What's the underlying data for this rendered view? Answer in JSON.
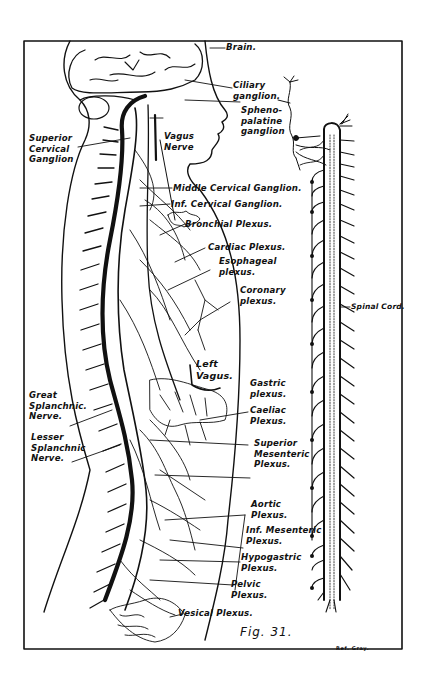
{
  "figure": {
    "caption": "Fig. 31.",
    "credit": "Ref. Gray.",
    "frame_color": "#111111",
    "background": "#ffffff"
  },
  "labels": {
    "brain": "Brain.",
    "ciliary_ganglion": "Ciliary\nganglion.",
    "sphenopalatine_ganglion": "Spheno-\npalatine\nganglion",
    "superior_cervical_ganglion": "Superior\nCervical\nGanglion",
    "vagus_nerve": "Vagus\nNerve",
    "middle_cervical_ganglion": "Middle Cervical Ganglion.",
    "inf_cervical_ganglion": "Inf. Cervical Ganglion.",
    "bronchial_plexus": "Bronchial Plexus.",
    "cardiac_plexus": "Cardiac Plexus.",
    "esophageal_plexus": "Esophageal\nplexus.",
    "coronary_plexus": "Coronary\nplexus.",
    "spinal_cord": "Spinal Cord.",
    "left_vagus": "Left\nVagus.",
    "gastric_plexus": "Gastric\nplexus.",
    "caeliac_plexus": "Caeliac\nPlexus.",
    "great_splanchnic_nerve": "Great\nSplanchnic.\nNerve.",
    "lesser_splanchnic_nerve": "Lesser\nSplanchnic\nNerve.",
    "superior_mesenteric_plexus": "Superior\nMesenteric\nPlexus.",
    "aortic_plexus": "Aortic\nPlexus.",
    "inf_mesenteric_plexus": "Inf. Mesenteric\nPlexus.",
    "hypogastric_plexus": "Hypogastric\nPlexus.",
    "pelvic_plexus": "Pelvic\nPlexus.",
    "vesical_plexus": "Vesical Plexus."
  }
}
